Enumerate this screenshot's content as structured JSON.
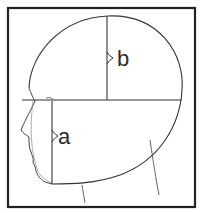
{
  "diagram": {
    "labels": {
      "a": "a",
      "b": "b"
    },
    "colors": {
      "line": "#333333",
      "frame": "#222222",
      "background": "#ffffff"
    }
  }
}
